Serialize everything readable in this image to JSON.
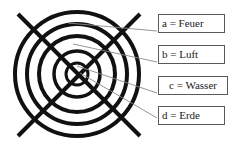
{
  "figure": {
    "colors": {
      "stroke": "#111111",
      "leader": "#8a8a8a",
      "box_border": "#5a5a5a",
      "text": "#1a1a1a",
      "background": "#ffffff"
    },
    "diagram": {
      "name": "four-elements-concentric-circles",
      "center": {
        "x": 77,
        "y": 74
      },
      "circles": [
        {
          "id": "a",
          "radius": 62,
          "stroke_width": 4
        },
        {
          "id": "b",
          "radius": 50,
          "stroke_width": 4
        },
        {
          "id": "c",
          "radius": 38,
          "stroke_width": 4
        },
        {
          "id": "d",
          "radius": 23,
          "stroke_width": 3.5
        },
        {
          "id": "core",
          "radius": 11,
          "stroke_width": 3
        }
      ],
      "cross": {
        "stroke_width": 4,
        "lines": [
          {
            "x1": 18,
            "y1": 14,
            "x2": 140,
            "y2": 136
          },
          {
            "x1": 140,
            "y1": 14,
            "x2": 18,
            "y2": 136
          }
        ]
      },
      "leader_lines": [
        {
          "for": "a",
          "x1": 68,
          "y1": 23,
          "x2": 157,
          "y2": 31
        },
        {
          "for": "b",
          "x1": 73,
          "y1": 44,
          "x2": 157,
          "y2": 62
        },
        {
          "for": "c",
          "x1": 77,
          "y1": 66,
          "x2": 157,
          "y2": 93
        },
        {
          "for": "d",
          "x1": 80,
          "y1": 73,
          "x2": 157,
          "y2": 118
        }
      ]
    },
    "legend": {
      "items": [
        {
          "key": "a",
          "label": "a = Feuer"
        },
        {
          "key": "b",
          "label": "b = Luft"
        },
        {
          "key": "c",
          "label": "c = Wasser"
        },
        {
          "key": "d",
          "label": "d = Erde"
        }
      ]
    }
  }
}
